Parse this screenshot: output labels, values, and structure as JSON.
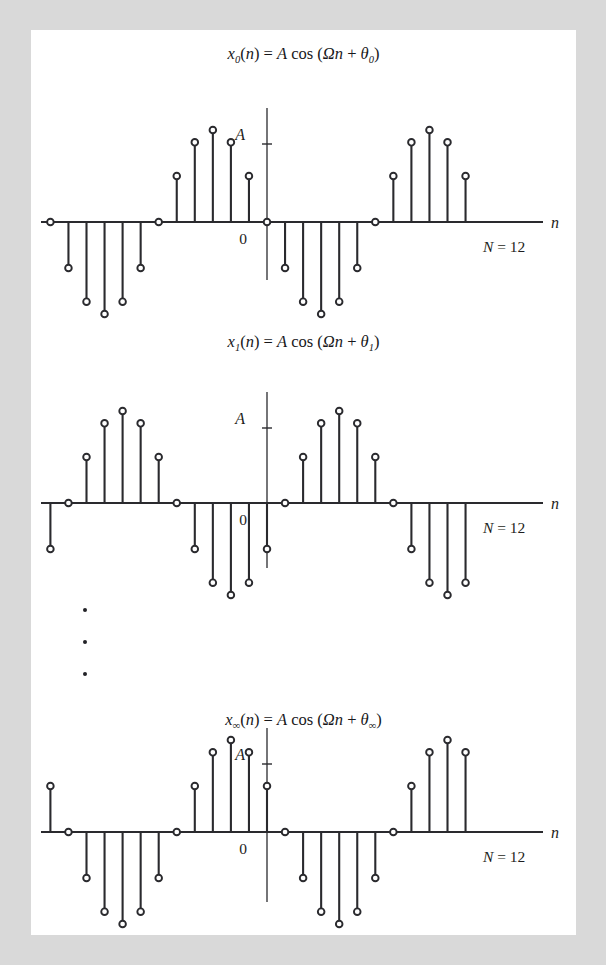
{
  "figure": {
    "background_color": "#d9d9d9",
    "page_color": "#ffffff",
    "stroke_color": "#2a2a2e",
    "text_color": "#1d1d20",
    "ellipsis_dots": 3
  },
  "chart_data": {
    "type": "scatter",
    "xlabel": "n",
    "ylabel": "A",
    "grid": false,
    "legend_position": "none",
    "shared": {
      "period_label": "N = 12",
      "amplitude_label": "A",
      "origin_label": "0",
      "axis_label_n": "n",
      "period_N": 12,
      "x_range": [
        -17,
        12
      ],
      "y_range": [
        -1,
        1
      ],
      "amplitude": 1
    },
    "panels": [
      {
        "id": "panel-0",
        "title_parts": {
          "x": "x",
          "sub": "0",
          "body": "(n) = A cos (Ωn + θ",
          "sub2": "0",
          "tail": ")"
        },
        "title_text": "x₀(n) = A cos (Ωn + θ₀)",
        "theta_index": "0",
        "phase_offset_samples": 0,
        "x": [
          -16,
          -15,
          -14,
          -13,
          -12,
          -11,
          -10,
          -9,
          -8,
          -7,
          -6,
          -5,
          -4,
          -3,
          -2,
          -1,
          0,
          1,
          2,
          3,
          4,
          5,
          6,
          7,
          8,
          9,
          10,
          11
        ],
        "y": [
          0.866,
          1.0,
          0.866,
          0.5,
          0.0,
          -0.5,
          -0.866,
          -1.0,
          -0.866,
          -0.5,
          0.0,
          0.5,
          0.866,
          1.0,
          0.866,
          0.5,
          0.0,
          -0.5,
          -0.866,
          -1.0,
          -0.866,
          -0.5,
          0.0,
          0.5,
          0.866,
          1.0,
          0.866,
          0.5
        ]
      },
      {
        "id": "panel-1",
        "title_parts": {
          "x": "x",
          "sub": "1",
          "body": "(n) = A cos (Ωn + θ",
          "sub2": "1",
          "tail": ")"
        },
        "title_text": "x₁(n) = A cos (Ωn + θ₁)",
        "theta_index": "1",
        "phase_offset_samples": 3,
        "x": [
          -16,
          -15,
          -14,
          -13,
          -12,
          -11,
          -10,
          -9,
          -8,
          -7,
          -6,
          -5,
          -4,
          -3,
          -2,
          -1,
          0,
          1,
          2,
          3,
          4,
          5,
          6,
          7,
          8,
          9,
          10,
          11
        ],
        "y": [
          -0.5,
          -0.866,
          -1.0,
          -0.866,
          -0.5,
          0.0,
          0.5,
          0.866,
          1.0,
          0.866,
          0.5,
          0.0,
          -0.5,
          -0.866,
          -1.0,
          -0.866,
          -0.5,
          0.0,
          0.5,
          0.866,
          1.0,
          0.866,
          0.5,
          0.0,
          -0.5,
          -0.866,
          -1.0,
          -0.866
        ]
      },
      {
        "id": "panel-inf",
        "title_parts": {
          "x": "x",
          "sub": "∞",
          "body": "(n) = A cos (Ωn + θ",
          "sub2": "∞",
          "tail": ")"
        },
        "title_text": "x∞(n) = A cos (Ωn + θ∞)",
        "theta_index": "∞",
        "phase_offset_samples": 1,
        "x": [
          -16,
          -15,
          -14,
          -13,
          -12,
          -11,
          -10,
          -9,
          -8,
          -7,
          -6,
          -5,
          -4,
          -3,
          -2,
          -1,
          0,
          1,
          2,
          3,
          4,
          5,
          6,
          7,
          8,
          9,
          10,
          11
        ],
        "y": [
          0.5,
          0.866,
          1.0,
          0.866,
          0.5,
          0.0,
          -0.5,
          -0.866,
          -1.0,
          -0.866,
          -0.5,
          0.0,
          0.5,
          0.866,
          1.0,
          0.866,
          0.5,
          0.0,
          -0.5,
          -0.866,
          -1.0,
          -0.866,
          -0.5,
          0.0,
          0.5,
          0.866,
          1.0,
          0.866
        ]
      }
    ]
  }
}
